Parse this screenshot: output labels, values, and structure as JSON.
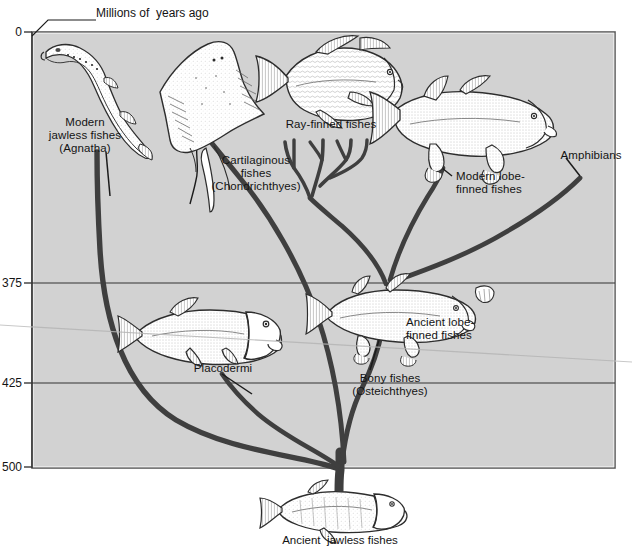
{
  "figure": {
    "axis_title": "Millions of  years ago",
    "bottom_caption": "Ancient  jawless fishes"
  },
  "axis": {
    "name": "time-axis",
    "unit": "millions of years ago",
    "ticks": [
      {
        "value": "0",
        "y": 32
      },
      {
        "value": "375",
        "y": 283
      },
      {
        "value": "425",
        "y": 383
      },
      {
        "value": "500",
        "y": 467
      }
    ]
  },
  "labels": [
    {
      "id": "modern-jawless",
      "text": "Modern\njawless fishes\n(Agnatha)",
      "x": 30,
      "y": 116,
      "w": 110
    },
    {
      "id": "cartilaginous",
      "text": "Cartilaginous\nfishes\n(Chondrichthyes)",
      "x": 196,
      "y": 154,
      "w": 120
    },
    {
      "id": "ray-finned",
      "text": "Ray-finned fishes",
      "x": 276,
      "y": 118,
      "w": 110
    },
    {
      "id": "modern-lobe-finned",
      "text": "Modern lobe-\nfinned fishes",
      "x": 456,
      "y": 170,
      "w": 96
    },
    {
      "id": "amphibians",
      "text": "Amphibians",
      "x": 552,
      "y": 149,
      "w": 78
    },
    {
      "id": "ancient-lobe-finned",
      "text": "Ancient lobe-\nfinned fishes",
      "x": 406,
      "y": 316,
      "w": 94
    },
    {
      "id": "bony-fishes",
      "text": "Bony fishes\n(Osteichthyes)",
      "x": 340,
      "y": 372,
      "w": 100
    },
    {
      "id": "placodermi",
      "text": "Placodermi",
      "x": 188,
      "y": 362,
      "w": 70
    }
  ],
  "organisms": [
    {
      "id": "lamprey",
      "common": "Modern jawless fishes"
    },
    {
      "id": "skate",
      "common": "Cartilaginous fishes"
    },
    {
      "id": "ray-finned-fish",
      "common": "Ray-finned fishes"
    },
    {
      "id": "modern-lobe-fin",
      "common": "Modern lobe-finned fishes"
    },
    {
      "id": "placoderm",
      "common": "Placodermi"
    },
    {
      "id": "ancient-lobe-fin",
      "common": "Ancient lobe-finned fishes"
    },
    {
      "id": "ancient-jawless-fish",
      "common": "Ancient jawless fishes"
    }
  ],
  "colors": {
    "panel_fill": "#d2d2d2",
    "panel_border": "#555555",
    "branch": "#3f3f3f",
    "leader": "#1b1b1b",
    "gridline": "#3a3a3a",
    "artifact": "#b9b9b9",
    "text": "#141414",
    "page": "#ffffff"
  },
  "panel": {
    "x": 32,
    "y": 32,
    "w": 583,
    "h": 436
  }
}
